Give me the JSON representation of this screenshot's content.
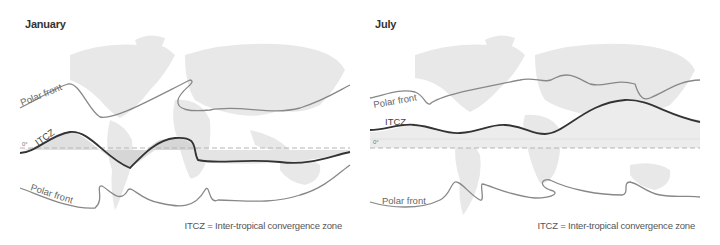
{
  "panels": [
    {
      "title": "January",
      "labels": {
        "polar_front_north": "Polar front",
        "itcz": "ITCZ",
        "equator": "0°",
        "polar_front_south": "Polar front"
      },
      "legend": "ITCZ = Inter-tropical convergence zone"
    },
    {
      "title": "July",
      "labels": {
        "polar_front_north": "Polar front",
        "itcz": "ITCZ",
        "equator": "0°",
        "polar_front_south": "Polar front"
      },
      "legend": "ITCZ = Inter-tropical convergence zone"
    }
  ],
  "colors": {
    "land": "#e6e6e6",
    "itcz_line": "#333333",
    "polar_front_line": "#888888",
    "equator_dash": "#b0b0b0",
    "itcz_shade": "#d4d4d4"
  }
}
